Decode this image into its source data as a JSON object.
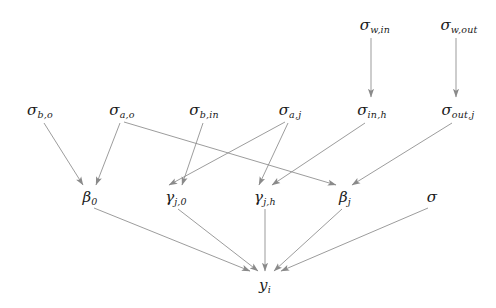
{
  "diagram": {
    "width": 496,
    "height": 308,
    "background_color": "#ffffff",
    "edge_color": "#8a8a8a",
    "text_color": "#1a1a1a",
    "node_count": 14,
    "edge_count": 15
  },
  "nodes": [
    {
      "id": "sigma_w_in",
      "base": "σ",
      "sub": "w,in",
      "label": "σ_w,in",
      "x": 375,
      "y": 25,
      "row": 1
    },
    {
      "id": "sigma_w_out",
      "base": "σ",
      "sub": "w,out",
      "label": "σ_w,out",
      "x": 459,
      "y": 25,
      "row": 1
    },
    {
      "id": "sigma_b_o",
      "base": "σ",
      "sub": "b,o",
      "label": "σ_b,o",
      "x": 40,
      "y": 110,
      "row": 2
    },
    {
      "id": "sigma_a_o",
      "base": "σ",
      "sub": "a,o",
      "label": "σ_a,o",
      "x": 122,
      "y": 110,
      "row": 2
    },
    {
      "id": "sigma_b_in",
      "base": "σ",
      "sub": "b,in",
      "label": "σ_b,in",
      "x": 204,
      "y": 110,
      "row": 2
    },
    {
      "id": "sigma_a_j",
      "base": "σ",
      "sub": "a,j",
      "label": "σ_a,j",
      "x": 290,
      "y": 110,
      "row": 2
    },
    {
      "id": "sigma_in_h",
      "base": "σ",
      "sub": "in,h",
      "label": "σ_in,h",
      "x": 372,
      "y": 110,
      "row": 2
    },
    {
      "id": "sigma_out_j",
      "base": "σ",
      "sub": "out,j",
      "label": "σ_out,j",
      "x": 458,
      "y": 110,
      "row": 2
    },
    {
      "id": "beta_0",
      "base": "β",
      "sub": "0",
      "label": "β_0",
      "x": 90,
      "y": 197,
      "row": 3
    },
    {
      "id": "gamma_j_0",
      "base": "γ",
      "sub": "j,0",
      "label": "γ_j,0",
      "x": 176,
      "y": 197,
      "row": 3
    },
    {
      "id": "gamma_j_h",
      "base": "γ",
      "sub": "j,h",
      "label": "γ_j,h",
      "x": 265,
      "y": 197,
      "row": 3
    },
    {
      "id": "beta_j",
      "base": "β",
      "sub": "j",
      "label": "β_j",
      "x": 345,
      "y": 197,
      "row": 3
    },
    {
      "id": "sigma",
      "base": "σ",
      "sub": "",
      "label": "σ",
      "x": 432,
      "y": 197,
      "row": 3
    },
    {
      "id": "y_i",
      "base": "y",
      "sub": "i",
      "label": "y_i",
      "x": 265,
      "y": 285,
      "row": 4
    }
  ],
  "edges": [
    {
      "from": "sigma_w_in",
      "to": "sigma_in_h",
      "x1": 371,
      "y1": 38,
      "x2": 371,
      "y2": 97
    },
    {
      "from": "sigma_w_out",
      "to": "sigma_out_j",
      "x1": 456,
      "y1": 38,
      "x2": 456,
      "y2": 97
    },
    {
      "from": "sigma_b_o",
      "to": "beta_0",
      "x1": 44,
      "y1": 123,
      "x2": 83,
      "y2": 185
    },
    {
      "from": "sigma_a_o",
      "to": "beta_0",
      "x1": 120,
      "y1": 123,
      "x2": 96,
      "y2": 185
    },
    {
      "from": "sigma_a_o",
      "to": "beta_j",
      "x1": 124,
      "y1": 122,
      "x2": 336,
      "y2": 185
    },
    {
      "from": "sigma_b_in",
      "to": "gamma_j_0",
      "x1": 203,
      "y1": 123,
      "x2": 182,
      "y2": 185
    },
    {
      "from": "sigma_a_j",
      "to": "gamma_j_0",
      "x1": 285,
      "y1": 122,
      "x2": 169,
      "y2": 185
    },
    {
      "from": "sigma_a_j",
      "to": "gamma_j_h",
      "x1": 288,
      "y1": 123,
      "x2": 259,
      "y2": 185
    },
    {
      "from": "sigma_in_h",
      "to": "gamma_j_h",
      "x1": 365,
      "y1": 123,
      "x2": 272,
      "y2": 185
    },
    {
      "from": "sigma_out_j",
      "to": "beta_j",
      "x1": 452,
      "y1": 123,
      "x2": 352,
      "y2": 185
    },
    {
      "from": "beta_0",
      "to": "y_i",
      "x1": 94,
      "y1": 208,
      "x2": 250,
      "y2": 271
    },
    {
      "from": "gamma_j_0",
      "to": "y_i",
      "x1": 178,
      "y1": 209,
      "x2": 258,
      "y2": 271
    },
    {
      "from": "gamma_j_h",
      "to": "y_i",
      "x1": 265,
      "y1": 209,
      "x2": 265,
      "y2": 271
    },
    {
      "from": "beta_j",
      "to": "y_i",
      "x1": 342,
      "y1": 209,
      "x2": 274,
      "y2": 271
    },
    {
      "from": "sigma",
      "to": "y_i",
      "x1": 428,
      "y1": 208,
      "x2": 281,
      "y2": 271
    }
  ]
}
